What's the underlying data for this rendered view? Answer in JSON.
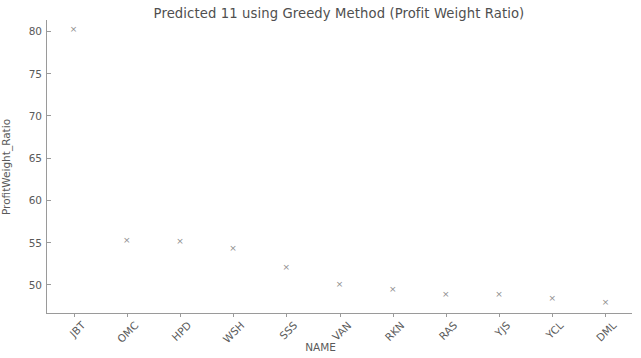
{
  "chart_data": {
    "type": "scatter",
    "title": "Predicted 11 using Greedy Method (Profit Weight Ratio)",
    "xlabel": "NAME",
    "ylabel": "ProfitWeight_Ratio",
    "categories": [
      "JBT",
      "OMC",
      "HPD",
      "WSH",
      "SSS",
      "VAN",
      "RKN",
      "RAS",
      "YJS",
      "YCL",
      "DML"
    ],
    "values": [
      80.2,
      55.2,
      55.1,
      54.2,
      52.0,
      50.0,
      49.4,
      48.8,
      48.8,
      48.3,
      47.8
    ],
    "series": [
      {
        "name": "ProfitWeight_Ratio",
        "values": [
          80.2,
          55.2,
          55.1,
          54.2,
          52.0,
          50.0,
          49.4,
          48.8,
          48.8,
          48.3,
          47.8
        ]
      }
    ],
    "ylim": [
      46.6,
      81.3
    ],
    "xlim": [
      -0.5,
      10.5
    ],
    "yticks": [
      50,
      55,
      60,
      65,
      70,
      75,
      80
    ],
    "ytick_labels": [
      "50",
      "55",
      "60",
      "65",
      "70",
      "75",
      "80"
    ],
    "xtick_labels": [
      "JBT",
      "OMC",
      "HPD",
      "WSH",
      "SSS",
      "VAN",
      "RKN",
      "RAS",
      "YJS",
      "YCL",
      "DML"
    ],
    "marker": "x",
    "marker_glyph": "×",
    "marker_color": "#8d8d8d",
    "grid": false,
    "legend": false,
    "background_color": "#ffffff",
    "axis_color": "#9a9a9a",
    "text_color": "#5a5a5a",
    "xtick_label_rotation": -45
  }
}
